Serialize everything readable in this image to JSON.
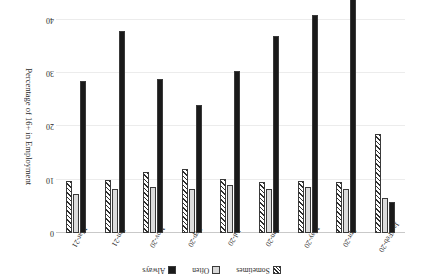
{
  "chart_data": {
    "type": "bar",
    "title": "",
    "xlabel": "",
    "ylabel": "Percentage of 16+ in Employment",
    "ylim": [
      0,
      40
    ],
    "yticks": [
      0,
      10,
      20,
      30,
      40
    ],
    "ytick_labels": [
      "0",
      "10",
      "20",
      "30",
      "40"
    ],
    "grid": true,
    "legend_position": "top",
    "orientation": "vertical-bars-rotated-180",
    "categories": [
      "Jan/Feb-20",
      "Apr-20",
      "May-20",
      "Jun-20",
      "Jul-20",
      "Sep-20",
      "Nov-20",
      "Jan-21",
      "Mar-21"
    ],
    "series": [
      {
        "name": "Always",
        "pattern": "solid-black",
        "values": [
          5.8,
          44.0,
          41.0,
          37.0,
          30.5,
          24.0,
          29.0,
          38.0,
          28.5
        ]
      },
      {
        "name": "Often",
        "pattern": "dotted-light-grey",
        "values": [
          6.5,
          8.2,
          8.7,
          8.2,
          9.0,
          8.3,
          8.6,
          8.3,
          7.4
        ]
      },
      {
        "name": "Sometimes",
        "pattern": "diagonal-hatch",
        "values": [
          18.5,
          9.6,
          9.8,
          9.5,
          10.2,
          12.0,
          11.4,
          10.0,
          9.8
        ]
      }
    ]
  },
  "legend": {
    "items": [
      {
        "label": "Sometimes",
        "swatch": "hatch-swatch-icon"
      },
      {
        "label": "Often",
        "swatch": "dotted-swatch-icon"
      },
      {
        "label": "Always",
        "swatch": "solid-swatch-icon"
      }
    ]
  },
  "axis": {
    "title": "Percentage of 16+ in Employment",
    "ticks": [
      "0",
      "10",
      "20",
      "30",
      "40"
    ]
  }
}
